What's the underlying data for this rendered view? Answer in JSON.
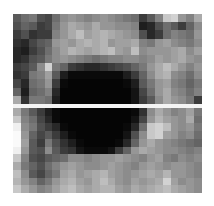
{
  "image": {
    "description": "Pixelated grayscale patch with a dark elliptical blob in the center, split by a thin white horizontal line",
    "divider_color": "#f4f4f4",
    "background": "#ffffff",
    "top_patch": {
      "rows": 11,
      "cols": 24,
      "gray": [
        [
          90,
          110,
          120,
          80,
          70,
          110,
          140,
          150,
          140,
          130,
          140,
          150,
          140,
          130,
          120,
          110,
          60,
          90,
          130,
          200,
          210,
          150,
          130,
          170
        ],
        [
          80,
          100,
          90,
          60,
          70,
          120,
          150,
          170,
          160,
          150,
          170,
          150,
          150,
          140,
          140,
          130,
          30,
          40,
          80,
          110,
          90,
          60,
          100,
          140
        ],
        [
          60,
          80,
          50,
          60,
          60,
          130,
          150,
          170,
          190,
          160,
          170,
          180,
          170,
          160,
          150,
          140,
          80,
          40,
          60,
          110,
          130,
          120,
          110,
          150
        ],
        [
          50,
          40,
          70,
          90,
          100,
          150,
          160,
          150,
          170,
          180,
          170,
          180,
          150,
          160,
          160,
          170,
          130,
          120,
          150,
          160,
          140,
          130,
          120,
          140
        ],
        [
          40,
          30,
          60,
          80,
          110,
          140,
          160,
          180,
          170,
          160,
          170,
          180,
          190,
          160,
          150,
          190,
          140,
          150,
          150,
          150,
          160,
          170,
          140,
          160
        ],
        [
          40,
          50,
          80,
          90,
          120,
          140,
          150,
          140,
          130,
          120,
          110,
          120,
          130,
          130,
          140,
          140,
          130,
          140,
          160,
          150,
          160,
          170,
          150,
          140
        ],
        [
          60,
          70,
          90,
          140,
          210,
          120,
          100,
          60,
          50,
          40,
          40,
          50,
          60,
          70,
          80,
          100,
          120,
          150,
          170,
          190,
          170,
          150,
          130,
          150
        ],
        [
          50,
          60,
          120,
          130,
          160,
          90,
          30,
          10,
          10,
          10,
          10,
          10,
          10,
          10,
          30,
          60,
          100,
          140,
          170,
          180,
          140,
          130,
          110,
          140
        ],
        [
          70,
          40,
          110,
          120,
          150,
          60,
          10,
          5,
          5,
          5,
          5,
          5,
          5,
          5,
          10,
          30,
          90,
          120,
          150,
          160,
          130,
          120,
          100,
          120
        ],
        [
          100,
          30,
          100,
          110,
          130,
          40,
          5,
          5,
          5,
          5,
          5,
          5,
          5,
          5,
          5,
          20,
          70,
          110,
          150,
          170,
          140,
          130,
          110,
          130
        ],
        [
          170,
          50,
          120,
          120,
          110,
          30,
          5,
          5,
          5,
          5,
          5,
          5,
          5,
          5,
          5,
          20,
          60,
          90,
          140,
          170,
          150,
          140,
          120,
          60
        ]
      ]
    },
    "bottom_patch": {
      "rows": 11,
      "cols": 24,
      "gray": [
        [
          170,
          120,
          90,
          60,
          30,
          10,
          5,
          5,
          5,
          5,
          5,
          5,
          5,
          5,
          5,
          10,
          50,
          140,
          170,
          150,
          130,
          140,
          160,
          120
        ],
        [
          200,
          130,
          110,
          70,
          40,
          10,
          5,
          5,
          5,
          5,
          5,
          5,
          5,
          5,
          5,
          20,
          70,
          150,
          180,
          160,
          150,
          140,
          170,
          110
        ],
        [
          240,
          140,
          120,
          80,
          60,
          40,
          10,
          5,
          5,
          5,
          5,
          5,
          5,
          5,
          10,
          40,
          110,
          200,
          210,
          190,
          150,
          140,
          150,
          120
        ],
        [
          250,
          150,
          100,
          70,
          90,
          60,
          30,
          10,
          5,
          5,
          5,
          5,
          5,
          5,
          20,
          80,
          140,
          200,
          210,
          160,
          150,
          130,
          140,
          110
        ],
        [
          250,
          160,
          90,
          60,
          120,
          80,
          50,
          30,
          10,
          5,
          5,
          5,
          5,
          10,
          40,
          100,
          150,
          170,
          150,
          140,
          130,
          120,
          110,
          100
        ],
        [
          240,
          150,
          90,
          80,
          140,
          90,
          60,
          50,
          20,
          10,
          10,
          10,
          20,
          60,
          100,
          150,
          170,
          160,
          150,
          140,
          140,
          130,
          120,
          130
        ],
        [
          200,
          130,
          80,
          70,
          90,
          100,
          110,
          140,
          140,
          130,
          140,
          150,
          150,
          160,
          150,
          140,
          130,
          150,
          160,
          130,
          120,
          140,
          130,
          140
        ],
        [
          170,
          120,
          100,
          80,
          110,
          130,
          150,
          160,
          150,
          140,
          140,
          150,
          160,
          150,
          140,
          130,
          150,
          160,
          150,
          140,
          150,
          150,
          140,
          130
        ],
        [
          190,
          140,
          90,
          70,
          100,
          120,
          160,
          170,
          150,
          160,
          170,
          180,
          160,
          150,
          140,
          150,
          160,
          170,
          160,
          180,
          150,
          150,
          140,
          130
        ],
        [
          180,
          150,
          130,
          100,
          120,
          150,
          170,
          180,
          160,
          150,
          170,
          190,
          170,
          150,
          140,
          160,
          150,
          160,
          170,
          210,
          160,
          140,
          150,
          140
        ],
        [
          200,
          170,
          150,
          130,
          140,
          160,
          180,
          190,
          170,
          160,
          170,
          180,
          180,
          160,
          150,
          170,
          160,
          170,
          180,
          190,
          170,
          160,
          150,
          140
        ]
      ]
    }
  }
}
